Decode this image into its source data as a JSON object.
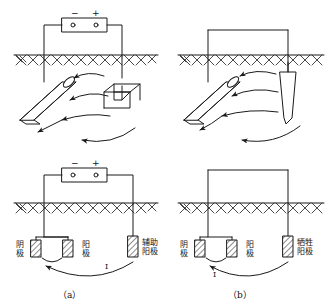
{
  "figure": {
    "title_caption_a": "（a）",
    "title_caption_b": "（b）",
    "stroke_color": "#1a1a1a",
    "background": "#ffffff"
  },
  "panel_a": {
    "caption": "（a）",
    "power_source": {
      "name": "dc-power-source",
      "minus_label": "−",
      "plus_label": "+"
    },
    "current_label": "I",
    "labels": [
      {
        "id": "cathode",
        "text": "阴\n极",
        "meaning": "cathode"
      },
      {
        "id": "anode",
        "text": "阳\n极",
        "meaning": "anode"
      },
      {
        "id": "auxiliary-anode",
        "text": "辅助\n阳极",
        "meaning": "auxiliary anode"
      }
    ],
    "upper": {
      "pipe_label": "",
      "auxiliary_anode_shape": "u-shaped-rod",
      "ground_label": ""
    }
  },
  "panel_b": {
    "caption": "（b）",
    "current_label": "I",
    "labels": [
      {
        "id": "cathode",
        "text": "阴\n极",
        "meaning": "cathode"
      },
      {
        "id": "anode",
        "text": "阳\n极",
        "meaning": "anode"
      },
      {
        "id": "sacrificial-anode",
        "text": "牺牲\n阳极",
        "meaning": "sacrificial anode"
      }
    ],
    "upper": {
      "pipe_label": "",
      "sacrificial_anode_shape": "tapered-rod",
      "ground_label": ""
    }
  }
}
